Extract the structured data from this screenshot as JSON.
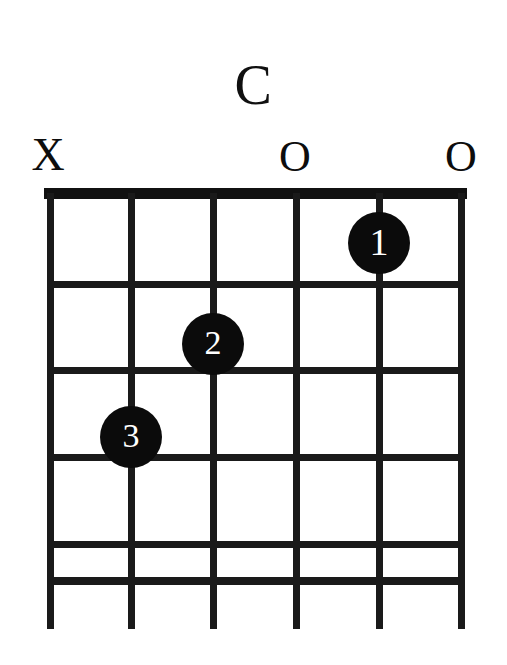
{
  "diagram": {
    "kind": "guitar-chord-diagram",
    "chord_name": "C",
    "instrument_strings": 6,
    "frets_shown": 5,
    "start_fret": 1,
    "ink_color": "#111111",
    "background_color": "#ffffff",
    "dot_text_color": "#ffffff"
  },
  "string_markers": [
    {
      "string": 6,
      "symbol": "X",
      "meaning": "muted",
      "x": 48,
      "y": 155
    },
    {
      "string": 5,
      "symbol": "",
      "meaning": "fretted",
      "x": 131,
      "y": 155
    },
    {
      "string": 4,
      "symbol": "",
      "meaning": "fretted",
      "x": 213,
      "y": 155
    },
    {
      "string": 3,
      "symbol": "O",
      "meaning": "open",
      "x": 295,
      "y": 157
    },
    {
      "string": 2,
      "symbol": "",
      "meaning": "fretted",
      "x": 379,
      "y": 155
    },
    {
      "string": 1,
      "symbol": "O",
      "meaning": "open",
      "x": 461,
      "y": 157
    }
  ],
  "finger_dots": [
    {
      "label": "1",
      "string": 2,
      "fret": 1,
      "x": 379,
      "y": 243,
      "radius": 31
    },
    {
      "label": "2",
      "string": 4,
      "fret": 2,
      "x": 213,
      "y": 344,
      "radius": 31
    },
    {
      "label": "3",
      "string": 5,
      "fret": 3,
      "x": 131,
      "y": 437,
      "radius": 31
    }
  ],
  "geometry": {
    "strings_x": [
      50,
      131,
      213,
      296,
      379,
      461
    ],
    "frets_y": [
      199,
      285,
      371,
      458,
      544,
      580
    ],
    "nut": {
      "x": 44,
      "y": 188,
      "width": 423,
      "height": 11
    },
    "string_bottom_y": 629,
    "string_width": 7,
    "fret_width": 7
  },
  "title_position": {
    "x": 250,
    "y": 85
  }
}
